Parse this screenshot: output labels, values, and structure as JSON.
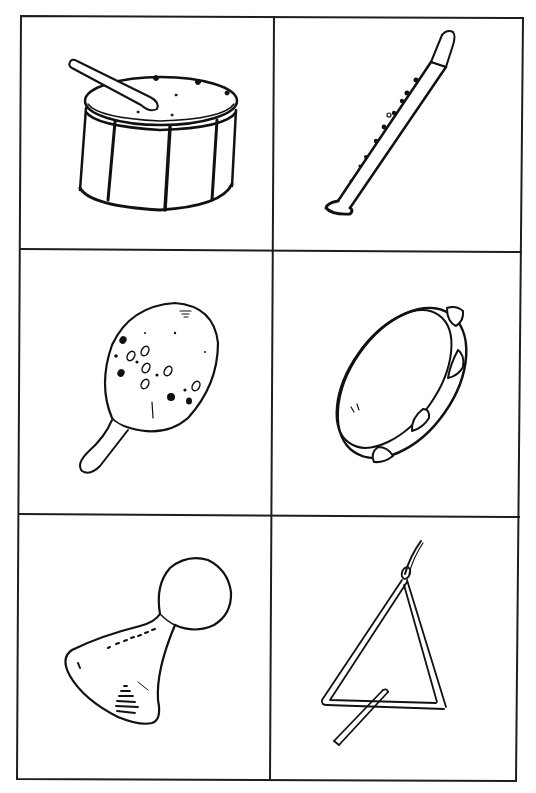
{
  "page": {
    "grid": {
      "rows": 3,
      "columns": 2,
      "line_color": "#1e1e1e",
      "background": "#ffffff"
    }
  },
  "cells": [
    {
      "row": 1,
      "column": 1,
      "instrument": "drum",
      "icon": "drum-icon",
      "label": "Drum with drumstick"
    },
    {
      "row": 1,
      "column": 2,
      "instrument": "recorder",
      "icon": "recorder-icon",
      "label": "Recorder"
    },
    {
      "row": 2,
      "column": 1,
      "instrument": "maraca",
      "icon": "maraca-icon",
      "label": "Maraca"
    },
    {
      "row": 2,
      "column": 2,
      "instrument": "tambourine",
      "icon": "tambourine-icon",
      "label": "Tambourine"
    },
    {
      "row": 3,
      "column": 1,
      "instrument": "shaker",
      "icon": "shaker-icon",
      "label": "Shaker"
    },
    {
      "row": 3,
      "column": 2,
      "instrument": "triangle",
      "icon": "triangle-icon",
      "label": "Triangle with beater"
    }
  ]
}
